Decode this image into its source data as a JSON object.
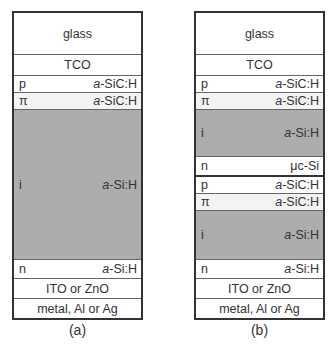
{
  "figure": {
    "panels": [
      {
        "caption": "(a)",
        "layers": [
          {
            "name": "glass",
            "label": "glass",
            "height": 42
          },
          {
            "name": "TCO",
            "label": "TCO",
            "height": 21
          },
          {
            "name": "p",
            "type": "p",
            "material_prefix": "a",
            "material_rest": "-SiC:H",
            "height": 17
          },
          {
            "name": "pi",
            "type": "π",
            "material_prefix": "a",
            "material_rest": "-SiC:H",
            "height": 17
          },
          {
            "name": "i",
            "type": "i",
            "material_prefix": "a",
            "material_rest": "-Si:H",
            "height": 150
          },
          {
            "name": "n",
            "type": "n",
            "material_prefix": "a",
            "material_rest": "-Si:H",
            "height": 19
          },
          {
            "name": "ito",
            "label": "ITO or ZnO",
            "height": 20
          },
          {
            "name": "metal",
            "label": "metal, Al or Ag",
            "height": 20
          }
        ]
      },
      {
        "caption": "(b)",
        "layers": [
          {
            "name": "glass",
            "label": "glass",
            "height": 42
          },
          {
            "name": "TCO",
            "label": "TCO",
            "height": 21
          },
          {
            "name": "p1",
            "type": "p",
            "material_prefix": "a",
            "material_rest": "-SiC:H",
            "height": 17
          },
          {
            "name": "pi1",
            "type": "π",
            "material_prefix": "a",
            "material_rest": "-SiC:H",
            "height": 17
          },
          {
            "name": "i1",
            "type": "i",
            "material_prefix": "a",
            "material_rest": "-Si:H",
            "height": 47
          },
          {
            "name": "n1",
            "type": "n",
            "material_prefix": "",
            "material_rest": "μc-Si",
            "height": 19
          },
          {
            "name": "p2",
            "type": "p",
            "material_prefix": "a",
            "material_rest": "-SiC:H",
            "height": 17
          },
          {
            "name": "pi2",
            "type": "π",
            "material_prefix": "a",
            "material_rest": "-SiC:H",
            "height": 17
          },
          {
            "name": "i2",
            "type": "i",
            "material_prefix": "a",
            "material_rest": "-Si:H",
            "height": 50
          },
          {
            "name": "n2",
            "type": "n",
            "material_prefix": "a",
            "material_rest": "-Si:H",
            "height": 19
          },
          {
            "name": "ito",
            "label": "ITO or ZnO",
            "height": 20
          },
          {
            "name": "metal",
            "label": "metal, Al or Ag",
            "height": 20
          }
        ]
      }
    ]
  }
}
